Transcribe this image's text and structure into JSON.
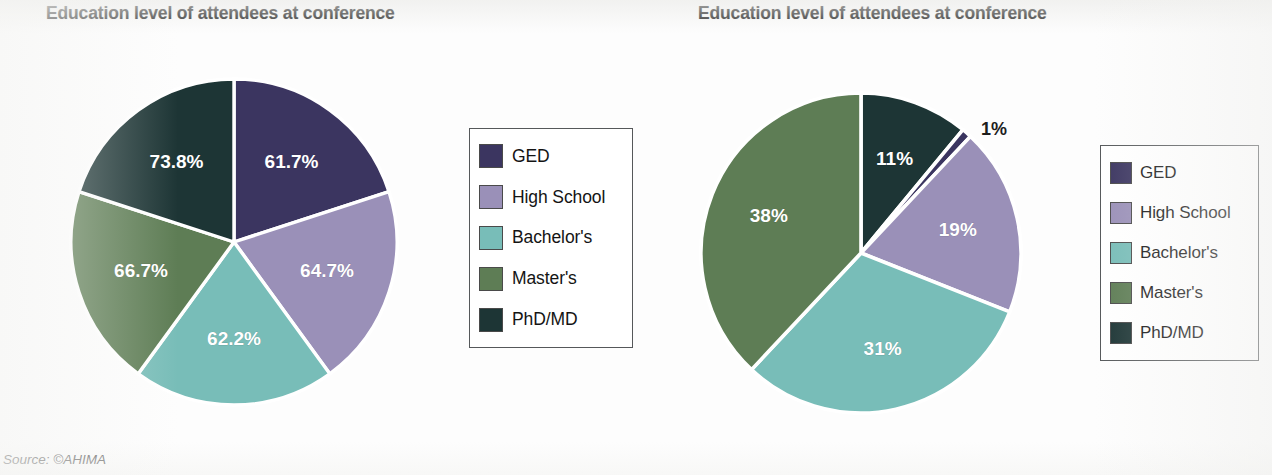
{
  "source_note": "Source: ©AHIMA",
  "colors": {
    "ged": "#3b3560",
    "high_school": "#9a90b8",
    "bachelors": "#78bdb8",
    "masters": "#5e7d55",
    "phd_md": "#1d3535",
    "slice_border": "#ffffff",
    "legend_border": "#55585a",
    "label_text": "#ffffff",
    "title_text": "#1c1c1c"
  },
  "left": {
    "title": "Education level of attendees at conference",
    "legend": [
      {
        "label": "GED",
        "color": "#3b3560"
      },
      {
        "label": "High School",
        "color": "#9a90b8"
      },
      {
        "label": "Bachelor's",
        "color": "#78bdb8"
      },
      {
        "label": "Master's",
        "color": "#5e7d55"
      },
      {
        "label": "PhD/MD",
        "color": "#1d3535"
      }
    ]
  },
  "right": {
    "title": "Education level of attendees at conference",
    "legend": [
      {
        "label": "GED",
        "color": "#3b3560"
      },
      {
        "label": "High School",
        "color": "#9a90b8"
      },
      {
        "label": "Bachelor's",
        "color": "#78bdb8"
      },
      {
        "label": "Master's",
        "color": "#5e7d55"
      },
      {
        "label": "PhD/MD",
        "color": "#1d3535"
      }
    ]
  },
  "chart_data": [
    {
      "type": "pie",
      "id": "left-pie",
      "title": "Education level of attendees at conference",
      "legend_position": "right",
      "note": "Slices drawn at equal 72 degree size; printed labels are independent percentages that do not sum to 100",
      "equal_slices": true,
      "categories": [
        "GED",
        "High School",
        "Bachelor's",
        "Master's",
        "PhD/MD"
      ],
      "values": [
        61.7,
        64.7,
        62.2,
        66.7,
        73.8
      ],
      "labels": [
        "61.7%",
        "64.7%",
        "62.2%",
        "66.7%",
        "73.8%"
      ],
      "colors": [
        "#3b3560",
        "#9a90b8",
        "#78bdb8",
        "#5e7d55",
        "#1d3535"
      ],
      "slice_angles_deg": [
        72,
        72,
        72,
        72,
        72
      ],
      "start_angle_deg": 0
    },
    {
      "type": "pie",
      "id": "right-pie",
      "title": "Education level of attendees at conference",
      "legend_position": "right",
      "equal_slices": false,
      "categories": [
        "PhD/MD",
        "GED",
        "High School",
        "Bachelor's",
        "Master's"
      ],
      "values": [
        11,
        1,
        19,
        31,
        38
      ],
      "labels": [
        "11%",
        "1%",
        "19%",
        "31%",
        "38%"
      ],
      "colors": [
        "#1d3535",
        "#3b3560",
        "#9a90b8",
        "#78bdb8",
        "#5e7d55"
      ],
      "slice_angles_deg": [
        39.6,
        3.6,
        68.4,
        111.6,
        136.8
      ],
      "start_angle_deg": 0,
      "legend_order": [
        "GED",
        "High School",
        "Bachelor's",
        "Master's",
        "PhD/MD"
      ],
      "legend_values": [
        1,
        19,
        31,
        38,
        11
      ]
    }
  ]
}
